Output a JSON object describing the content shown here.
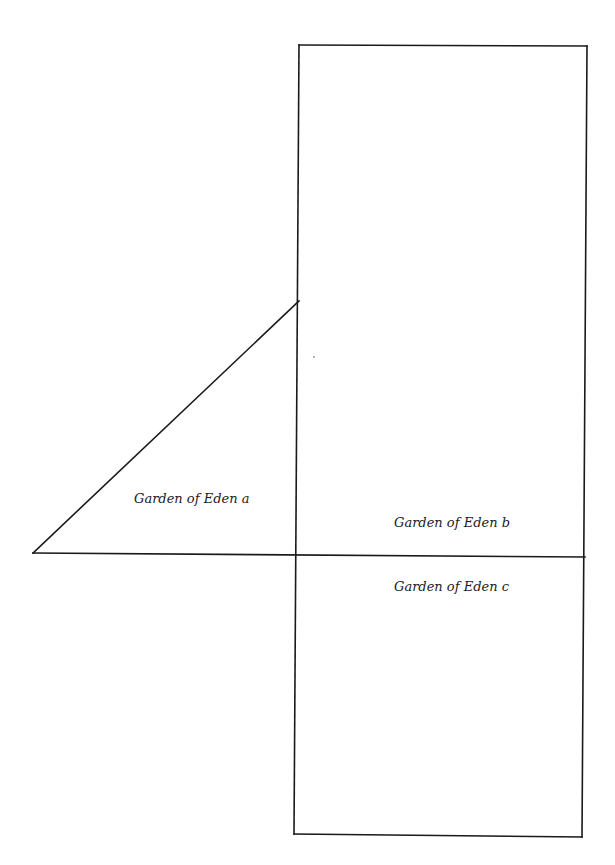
{
  "diagram": {
    "regions": [
      {
        "id": "a",
        "label": "Garden of Eden a"
      },
      {
        "id": "b",
        "label": "Garden of Eden b"
      },
      {
        "id": "c",
        "label": "Garden of Eden c"
      }
    ],
    "colors": {
      "stroke": "#1a1a1a",
      "background": "#ffffff"
    }
  }
}
